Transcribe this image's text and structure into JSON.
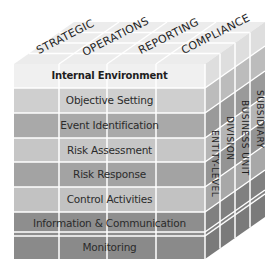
{
  "diagram": {
    "top_face": {
      "labels": [
        "STRATEGIC",
        "OPERATIONS",
        "REPORTING",
        "COMPLIANCE"
      ]
    },
    "front_face": {
      "rows": [
        {
          "label": "Internal Environment",
          "color": "#f0f0f0",
          "bold": true
        },
        {
          "label": "Objective Setting",
          "color": "#cfcfcf",
          "bold": false
        },
        {
          "label": "Event Identification",
          "color": "#a9a9a9",
          "bold": false
        },
        {
          "label": "Risk Assessment",
          "color": "#c6c6c6",
          "bold": false
        },
        {
          "label": "Risk Response",
          "color": "#a3a3a3",
          "bold": false
        },
        {
          "label": "Control Activities",
          "color": "#c2c2c2",
          "bold": false
        },
        {
          "label": "Information & Communication",
          "color": "#8e8e8e",
          "bold": false
        },
        {
          "label": "Monitoring",
          "color": "#8a8a8a",
          "bold": false
        }
      ],
      "columns": 4
    },
    "side_face": {
      "labels": [
        "ENTITY-LEVEL",
        "DIVISION",
        "BUSINESS UNIT",
        "SUBSIDIARY"
      ]
    },
    "colors": {
      "grid_line": "#ffffff",
      "top_face": "#eeeeee",
      "text": "#222222"
    }
  }
}
